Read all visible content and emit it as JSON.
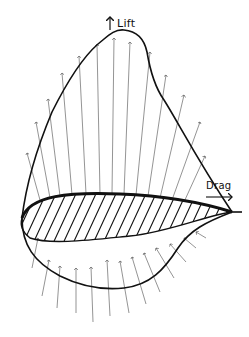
{
  "diagram": {
    "type": "airfoil-pressure-distribution",
    "labels": {
      "lift": "Lift",
      "drag": "Drag"
    },
    "colors": {
      "background": "#ffffff",
      "ink": "#111111",
      "arrows": "#555555"
    },
    "elements": [
      "airfoil cross-section (hatched)",
      "upper surface suction arrows (outward, upward)",
      "lower surface pressure arrows (inward, upward)",
      "upper pressure envelope curve",
      "lower pressure envelope curve",
      "lift arrow (vertical)",
      "drag arrow (horizontal)"
    ]
  }
}
